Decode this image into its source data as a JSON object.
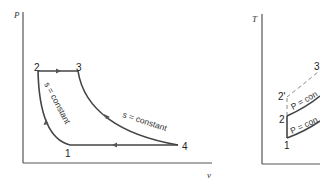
{
  "pv_diagram": {
    "y_axis_label": "P",
    "x_axis_label": "v",
    "points": [
      {
        "label": "1",
        "x": 70,
        "y": 145
      },
      {
        "label": "2",
        "x": 38,
        "y": 71
      },
      {
        "label": "3",
        "x": 78,
        "y": 71
      },
      {
        "label": "4",
        "x": 178,
        "y": 145
      }
    ],
    "processes": [
      {
        "from": "1",
        "to": "2",
        "annotation": "s = constant"
      },
      {
        "from": "2",
        "to": "3",
        "annotation": ""
      },
      {
        "from": "3",
        "to": "4",
        "annotation": "s = constant"
      },
      {
        "from": "4",
        "to": "1",
        "annotation": ""
      }
    ],
    "annotation_left": "s = constant",
    "annotation_right": "s = constant"
  },
  "ts_diagram": {
    "y_axis_label": "T",
    "points": [
      {
        "label": "1"
      },
      {
        "label": "2"
      },
      {
        "label": "2'"
      },
      {
        "label": "3"
      }
    ],
    "annotation_upper": "P = con",
    "annotation_lower": "P = con"
  }
}
